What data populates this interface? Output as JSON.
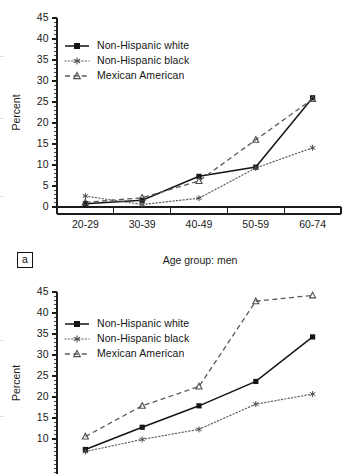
{
  "figure": {
    "panel_a_tag": "a",
    "y_axis_label": "Percent",
    "x_axis_label_a": "Age group: men"
  },
  "legend": {
    "items": [
      {
        "label": "Non-Hispanic white",
        "key": "solid-square-line",
        "color": "#151515"
      },
      {
        "label": "Non-Hispanic black",
        "key": "dotted-star-line",
        "color": "#5d5d5d"
      },
      {
        "label": "Mexican American",
        "key": "dashed-triangle-line",
        "color": "#5a5a5a"
      }
    ]
  },
  "chart_data": [
    {
      "type": "line",
      "title": "",
      "panel": "a",
      "xlabel": "Age group: men",
      "ylabel": "Percent",
      "categories": [
        "20-29",
        "30-39",
        "40-49",
        "50-59",
        "60-74"
      ],
      "ylim": [
        0,
        45
      ],
      "yticks": [
        0,
        5,
        10,
        15,
        20,
        25,
        30,
        35,
        40,
        45
      ],
      "minor_tick_step": 1,
      "grid": false,
      "legend_position": "upper-left",
      "series": [
        {
          "name": "Non-Hispanic white",
          "values": [
            0.8,
            1.6,
            7.3,
            9.5,
            26.0
          ],
          "marker": "square",
          "line": "solid"
        },
        {
          "name": "Non-Hispanic black",
          "values": [
            2.6,
            0.6,
            2.1,
            9.3,
            14.1
          ],
          "marker": "star",
          "line": "dotted"
        },
        {
          "name": "Mexican American",
          "values": [
            1.1,
            2.2,
            6.2,
            16.0,
            25.7
          ],
          "marker": "triangle",
          "line": "dashed"
        }
      ]
    },
    {
      "type": "line",
      "title": "",
      "panel": "b",
      "xlabel": "",
      "ylabel": "Percent",
      "categories": [
        "20-29",
        "30-39",
        "40-49",
        "50-59",
        "60-74"
      ],
      "ylim": [
        0,
        45
      ],
      "yticks": [
        10,
        15,
        20,
        25,
        30,
        35,
        40,
        45
      ],
      "minor_tick_step": 1,
      "grid": false,
      "legend_position": "upper-left",
      "note": "Panel is cropped at the bottom of the screenshot; lowest plotted values fall below the visible area.",
      "series": [
        {
          "name": "Non-Hispanic white",
          "values": [
            7.5,
            12.8,
            17.9,
            23.7,
            34.3
          ],
          "marker": "square",
          "line": "solid"
        },
        {
          "name": "Non-Hispanic black",
          "values": [
            7.0,
            9.9,
            12.3,
            18.3,
            20.7
          ],
          "marker": "star",
          "line": "dotted"
        },
        {
          "name": "Mexican American",
          "values": [
            10.6,
            17.9,
            22.5,
            42.8,
            44.2
          ],
          "marker": "triangle",
          "line": "dashed"
        }
      ]
    }
  ]
}
